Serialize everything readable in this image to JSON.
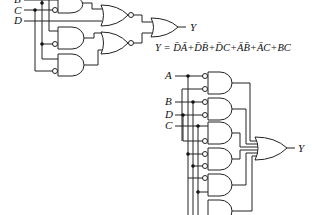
{
  "circuit1": {
    "inputs": [
      "B",
      "C",
      "D"
    ],
    "output_label": "Y",
    "equation_prefix": "Y = ",
    "equation_terms": [
      "D̄Ā",
      "D̄B̄",
      "D̄C",
      "ĀB̄",
      "ĀC",
      "BC"
    ],
    "equation_text": "Y = D̄Ā+D̄B̄+D̄C+ĀB̄+ĀC+BC"
  },
  "circuit2": {
    "inputs": [
      "A",
      "B",
      "D",
      "C"
    ],
    "output_label": "Y"
  }
}
